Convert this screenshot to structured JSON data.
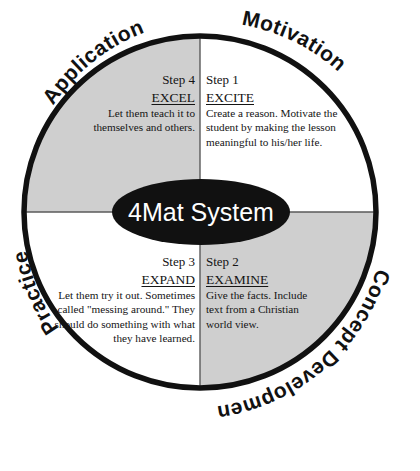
{
  "diagram": {
    "title": "4Mat System",
    "center_label": "4Mat System",
    "colors": {
      "shaded_quadrant": "#cfcfcf",
      "plain_quadrant": "#ffffff",
      "ring_stroke": "#111111",
      "divider": "#5a5a5a",
      "center_fill": "#111111",
      "center_text": "#ffffff",
      "body_text": "#141414"
    },
    "geometry": {
      "center_x": 200,
      "center_y": 212,
      "radius": 176,
      "ellipse_rx": 89,
      "ellipse_ry": 33
    },
    "arc_labels": [
      {
        "name": "application",
        "text": "Application"
      },
      {
        "name": "motivation",
        "text": "Motivation"
      },
      {
        "name": "concept-development",
        "text": "Concept Development"
      },
      {
        "name": "practice",
        "text": "Practice"
      }
    ],
    "quadrants": [
      {
        "id": "step4",
        "position": "top-left",
        "shaded": true,
        "step": "Step 4",
        "keyword": "EXCEL",
        "body": "Let them teach it to themselves and others."
      },
      {
        "id": "step1",
        "position": "top-right",
        "shaded": false,
        "step": "Step 1",
        "keyword": "EXCITE",
        "body": "Create a reason. Motivate the student by making the lesson meaningful to his/her life."
      },
      {
        "id": "step3",
        "position": "bottom-left",
        "shaded": false,
        "step": "Step 3",
        "keyword": "EXPAND",
        "body": "Let them try it out. Sometimes called \"messing around.\" They should do something with what they have learned."
      },
      {
        "id": "step2",
        "position": "bottom-right",
        "shaded": true,
        "step": "Step 2",
        "keyword": "EXAMINE",
        "body": "Give the facts. Include text from a Christian world view."
      }
    ]
  }
}
